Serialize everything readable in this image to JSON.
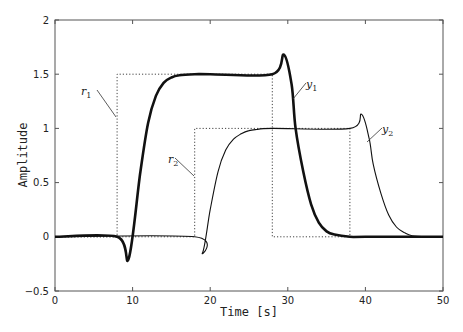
{
  "chart_data": {
    "type": "line",
    "title": "",
    "xlabel": "Time [s]",
    "ylabel": "Amplitude",
    "xlim": [
      0,
      50
    ],
    "ylim": [
      -0.5,
      2
    ],
    "xticks": [
      0,
      10,
      20,
      30,
      40,
      50
    ],
    "yticks": [
      -0.5,
      0,
      0.5,
      1,
      1.5,
      2
    ],
    "ytick_labels": [
      "-0.5",
      "0",
      "0.5",
      "1",
      "1.5",
      "2"
    ],
    "grid": false,
    "legend": "none (inline annotations)",
    "series": [
      {
        "name": "r1",
        "style": "dotted",
        "x": [
          0,
          8,
          8,
          28,
          28,
          50
        ],
        "y": [
          0,
          0,
          1.5,
          1.5,
          0,
          0
        ]
      },
      {
        "name": "r2",
        "style": "dotted",
        "x": [
          0,
          18,
          18,
          38,
          38,
          50
        ],
        "y": [
          0,
          0,
          1.0,
          1.0,
          0,
          0
        ]
      },
      {
        "name": "y1",
        "style": "thick solid",
        "x": [
          0,
          8,
          9.5,
          11,
          12,
          13,
          14,
          15,
          16,
          18,
          20,
          28,
          29.5,
          30.5,
          31,
          32,
          33,
          34,
          35,
          36,
          38,
          40,
          50
        ],
        "y": [
          0,
          0,
          -0.2,
          0.6,
          1.05,
          1.3,
          1.42,
          1.47,
          1.49,
          1.5,
          1.5,
          1.5,
          1.68,
          1.4,
          1.0,
          0.6,
          0.3,
          0.13,
          0.05,
          0.02,
          0,
          0,
          0
        ]
      },
      {
        "name": "y2",
        "style": "thin solid",
        "x": [
          0,
          18,
          19,
          20,
          21,
          22,
          23,
          24,
          25,
          26,
          28,
          38,
          39.5,
          40.5,
          41,
          42,
          43,
          44,
          45,
          46,
          48,
          50
        ],
        "y": [
          0,
          0,
          -0.15,
          0.25,
          0.6,
          0.8,
          0.9,
          0.95,
          0.98,
          0.99,
          1.0,
          1.0,
          1.13,
          0.9,
          0.67,
          0.4,
          0.2,
          0.09,
          0.04,
          0.01,
          0,
          0
        ]
      }
    ],
    "annotations": [
      {
        "text": "r1",
        "target": "r1",
        "at": [
          8,
          1.1
        ]
      },
      {
        "text": "r2",
        "target": "r2",
        "at": [
          18,
          0.8
        ]
      },
      {
        "text": "y1",
        "target": "y1",
        "at": [
          30.5,
          1.28
        ]
      },
      {
        "text": "y2",
        "target": "y2",
        "at": [
          40.5,
          0.92
        ]
      }
    ]
  },
  "labels": {
    "xlabel": "Time [s]",
    "ylabel": "Amplitude",
    "r1": "r",
    "r1_sub": "1",
    "r2": "r",
    "r2_sub": "2",
    "y1": "y",
    "y1_sub": "1",
    "y2": "y",
    "y2_sub": "2"
  }
}
